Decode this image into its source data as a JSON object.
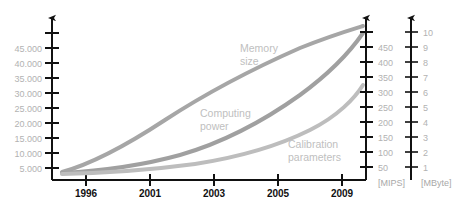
{
  "chart_data": {
    "type": "line",
    "title": "",
    "xlabel": "",
    "grid": false,
    "legend": "inline-annotations",
    "x_axis": {
      "tick_labels": [
        "1996",
        "2001",
        "2003",
        "2005",
        "2009"
      ],
      "tick_x_px": [
        86,
        150,
        214,
        278,
        342
      ]
    },
    "axes": [
      {
        "id": "left",
        "unit": "",
        "position": "left",
        "tick_labels": [
          "5.000",
          "10.000",
          "15.000",
          "20.000",
          "25.000",
          "30.000",
          "35.000",
          "40.000",
          "45.000"
        ],
        "values": [
          5000,
          10000,
          15000,
          20000,
          25000,
          30000,
          35000,
          40000,
          45000
        ],
        "range": [
          0,
          47000
        ]
      },
      {
        "id": "mips",
        "unit": "[MIPS]",
        "position": "right-inner",
        "tick_labels": [
          "50",
          "100",
          "150",
          "200",
          "250",
          "300",
          "350",
          "400",
          "450"
        ],
        "values": [
          50,
          100,
          150,
          200,
          250,
          300,
          350,
          400,
          450
        ],
        "range": [
          0,
          470
        ]
      },
      {
        "id": "mbyte",
        "unit": "[MByte]",
        "position": "right-outer",
        "tick_labels": [
          "1",
          "2",
          "3",
          "4",
          "5",
          "6",
          "7",
          "8",
          "9",
          "10"
        ],
        "values": [
          1,
          2,
          3,
          4,
          5,
          6,
          7,
          8,
          9,
          10
        ],
        "range": [
          0,
          10.5
        ]
      }
    ],
    "series": [
      {
        "name": "Memory size",
        "label_lines": [
          "Memory",
          "size"
        ],
        "axis": "mbyte",
        "color": "#a6a6a6",
        "x": [
          1995,
          1996,
          1998,
          2001,
          2003,
          2005,
          2007,
          2009,
          2011
        ],
        "values": [
          0.15,
          0.3,
          1.1,
          2.6,
          4.0,
          5.6,
          7.3,
          8.9,
          10.2
        ],
        "path": "M 62,172 C 95,163 130,143 165,120 C 205,94 250,70 300,48 C 330,36 350,30 363,26"
      },
      {
        "name": "Computing power",
        "label_lines": [
          "Computing",
          "power"
        ],
        "axis": "mips",
        "color": "#a0a0a0",
        "x": [
          1995,
          1996,
          1998,
          2001,
          2003,
          2005,
          2007,
          2009,
          2011
        ],
        "values": [
          10,
          15,
          35,
          75,
          120,
          185,
          280,
          370,
          430
        ],
        "path": "M 62,173 C 100,171 140,166 180,155 C 225,142 265,120 300,95 C 330,73 350,52 363,33"
      },
      {
        "name": "Calibration parameters",
        "label_lines": [
          "Calibration",
          "parameters"
        ],
        "axis": "mips",
        "color": "#bdbdbd",
        "x": [
          1995,
          1996,
          1998,
          2001,
          2003,
          2005,
          2007,
          2009,
          2011
        ],
        "values": [
          8,
          12,
          25,
          45,
          70,
          100,
          150,
          205,
          255
        ],
        "path": "M 62,174 C 105,173 150,170 195,164 C 240,157 278,146 310,130 C 338,116 355,98 363,85"
      }
    ],
    "annotations": [
      {
        "name": "memory-size-label",
        "lines": [
          "Memory",
          "size"
        ],
        "x": 240,
        "y": 52
      },
      {
        "name": "computing-power-label",
        "lines": [
          "Computing",
          "power"
        ],
        "x": 200,
        "y": 117
      },
      {
        "name": "calibration-parameters-label",
        "lines": [
          "Calibration",
          "parameters"
        ],
        "x": 288,
        "y": 148
      }
    ],
    "unit_labels": [
      {
        "name": "mips-unit-label",
        "text": "[MIPS]",
        "x": 378,
        "y": 185
      },
      {
        "name": "mbyte-unit-label",
        "text": "[MByte]",
        "x": 422,
        "y": 185
      }
    ]
  }
}
